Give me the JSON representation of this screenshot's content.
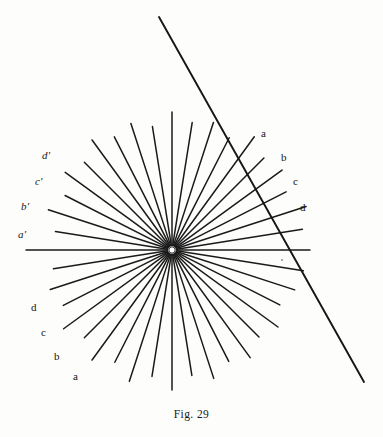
{
  "figure": {
    "caption": "Fig. 29",
    "background_color": "#fdfdfb",
    "ink_color": "#1a1a1a",
    "center": {
      "x": 172,
      "y": 250
    },
    "hub_radius": 3.2,
    "ray_count": 40,
    "ray_angle_step_deg": 9,
    "ray_min_length": 100,
    "ray_max_length": 148,
    "ray_stroke_width": 1.5,
    "secant_line": {
      "name": "oblique-line",
      "x1": 159,
      "y1": 17,
      "x2": 364,
      "y2": 382,
      "stroke_width": 1.9
    }
  },
  "labels": {
    "right": [
      {
        "text": "a",
        "x": 261,
        "y": 128
      },
      {
        "text": "b",
        "x": 281,
        "y": 152
      },
      {
        "text": "c",
        "x": 293,
        "y": 176
      },
      {
        "text": "d",
        "x": 300,
        "y": 202
      }
    ],
    "left_upper": [
      {
        "text": "d′",
        "x": 42,
        "y": 150
      },
      {
        "text": "c′",
        "x": 35,
        "y": 176
      },
      {
        "text": "b′",
        "x": 21,
        "y": 201
      },
      {
        "text": "a′",
        "x": 18,
        "y": 229
      }
    ],
    "left_lower": [
      {
        "text": "d",
        "x": 31,
        "y": 302
      },
      {
        "text": "c",
        "x": 41,
        "y": 327
      },
      {
        "text": "b",
        "x": 54,
        "y": 351
      },
      {
        "text": "a",
        "x": 73,
        "y": 371
      }
    ]
  },
  "chart_data": {
    "type": "diagram",
    "title": "Fig. 29",
    "center": [
      172,
      250
    ],
    "ray_angles_deg": [
      0,
      9,
      18,
      27,
      36,
      45,
      54,
      63,
      72,
      81,
      90,
      99,
      108,
      117,
      126,
      135,
      144,
      153,
      162,
      171,
      180,
      189,
      198,
      207,
      216,
      225,
      234,
      243,
      252,
      261,
      270,
      279,
      288,
      297,
      306,
      315,
      324,
      333,
      342,
      351
    ],
    "ray_lengths": [
      138,
      132,
      141,
      128,
      136,
      130,
      140,
      126,
      134,
      129,
      138,
      125,
      133,
      127,
      136,
      124,
      132,
      120,
      130,
      118,
      146,
      120,
      128,
      122,
      134,
      124,
      136,
      126,
      138,
      128,
      140,
      127,
      135,
      125,
      133,
      123,
      131,
      121,
      129,
      133
    ],
    "labelled_rays": {
      "right": [
        "a",
        "b",
        "c",
        "d"
      ],
      "left_upper": [
        "d′",
        "c′",
        "b′",
        "a′"
      ],
      "left_lower": [
        "d",
        "c",
        "b",
        "a"
      ]
    },
    "secant": {
      "from": [
        159,
        17
      ],
      "to": [
        364,
        382
      ]
    },
    "xlabel": "",
    "ylabel": "",
    "grid": false,
    "legend": "none"
  }
}
